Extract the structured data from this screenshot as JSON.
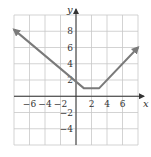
{
  "chart_data": {
    "type": "line",
    "title": "",
    "xlabel": "x",
    "ylabel": "y",
    "xlim": [
      -8,
      8
    ],
    "ylim": [
      -6,
      10
    ],
    "grid": true,
    "grid_step": 2,
    "x_ticks": [
      -6,
      -4,
      -2,
      2,
      4,
      6
    ],
    "x_tick_labels": [
      "−6",
      "−4",
      "−2",
      "2",
      "4",
      "6"
    ],
    "y_ticks": [
      8,
      6,
      4,
      2,
      -2,
      -4
    ],
    "y_tick_labels": [
      "8",
      "6",
      "4",
      "2",
      "−2",
      "−4"
    ],
    "series": [
      {
        "name": "f(x)",
        "points": [
          [
            -8,
            8.2
          ],
          [
            1,
            1
          ],
          [
            3,
            1
          ],
          [
            8,
            6
          ]
        ],
        "arrows": [
          "start",
          "end"
        ],
        "color": "#7a7a7a"
      }
    ]
  },
  "colors": {
    "grid": "#c8c8c8",
    "axis": "#333333",
    "line": "#7a7a7a"
  }
}
